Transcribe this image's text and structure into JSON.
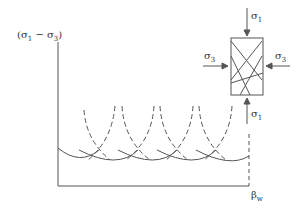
{
  "diagram": {
    "y_axis_label": {
      "prefix": "(σ",
      "sub1": "1",
      "mid": " − σ",
      "sub2": "3",
      "suffix": ")"
    },
    "x_axis_label": {
      "main": "β",
      "sub": "w"
    },
    "specimen": {
      "top_load": {
        "main": "σ",
        "sub": "1"
      },
      "bottom_load": {
        "main": "σ",
        "sub": "1"
      },
      "left_load": {
        "main": "σ",
        "sub": "3"
      },
      "right_load": {
        "main": "σ",
        "sub": "3"
      }
    },
    "curves": {
      "solid_description": "Strength envelope: intersecting solid arcs",
      "dashed_description": "Individual plane strength curves (dashed)"
    },
    "colors": {
      "line": "#555555",
      "text": "#333333",
      "background": "#ffffff"
    }
  }
}
